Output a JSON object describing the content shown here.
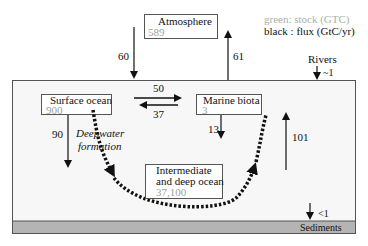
{
  "legend": {
    "stock": "green: stock (GTC)",
    "flux": "black : flux (GtC/yr)"
  },
  "colors": {
    "stock_text": "#9aa39a",
    "flux_text": "#111111",
    "ocean_fill": "#f7f7f7",
    "sediment_fill": "#b4b4b4",
    "border": "#555555"
  },
  "reservoirs": {
    "atmosphere": {
      "name": "Atmosphere",
      "stock": "589"
    },
    "surface_ocean": {
      "name": "Surface ocean",
      "stock": "900"
    },
    "marine_biota": {
      "name": "Marine biota",
      "stock": "3"
    },
    "deep_ocean": {
      "name_line1": "Intermediate",
      "name_line2": "and deep ocean",
      "stock": "37,100"
    },
    "sediments": {
      "name": "Sediments"
    }
  },
  "fluxes": {
    "atm_to_ocean": "60",
    "ocean_to_atm": "61",
    "rivers_label": "Rivers",
    "rivers": "~1",
    "surface_to_biota": "50",
    "biota_to_surface": "37",
    "biota_to_deep": "13",
    "surface_to_deep": "90",
    "deep_to_surface": "101",
    "to_sediments": "<1"
  },
  "annotations": {
    "deepwater_line1": "Deepwater",
    "deepwater_line2": "formation"
  }
}
